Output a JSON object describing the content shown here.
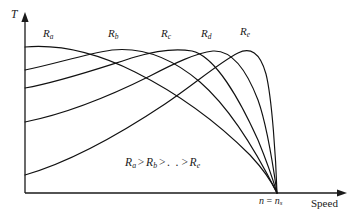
{
  "figure": {
    "background_color": "#ffffff",
    "line_color": "#111111",
    "axes": {
      "y_label": "T",
      "x_label": "Speed",
      "origin": [
        25,
        193
      ],
      "y_top": [
        25,
        15
      ],
      "x_right": [
        345,
        193
      ]
    },
    "tick": {
      "label_main": "n",
      "label_equals": " = ",
      "label_sub_base": "n",
      "label_sub": "s",
      "x": 277
    },
    "relation": {
      "terms": [
        "R",
        "R",
        "R"
      ],
      "subs": [
        "a",
        "b",
        "e"
      ],
      "operator": ">",
      "ellipsis": ". .",
      "text": "Ra > Rb > . . > Re"
    },
    "curve_labels": [
      {
        "base": "R",
        "sub": "a",
        "x": 43,
        "y": 28
      },
      {
        "base": "R",
        "sub": "b",
        "x": 108,
        "y": 28
      },
      {
        "base": "R",
        "sub": "c",
        "x": 161,
        "y": 28
      },
      {
        "base": "R",
        "sub": "d",
        "x": 201,
        "y": 28
      },
      {
        "base": "R",
        "sub": "e",
        "x": 240,
        "y": 26
      }
    ]
  },
  "chart_data": {
    "type": "line",
    "title": "",
    "xlabel": "Speed",
    "ylabel": "T",
    "grid": false,
    "legend": "inline-curve-labels",
    "annotations": [
      {
        "text": "Ra > Rb > . . > Re",
        "x_px": 125,
        "y_px": 158
      },
      {
        "text": "n = ns",
        "x_px": 261,
        "y_px": 195
      }
    ],
    "axis_note": "Torque (T) versus Speed; all curves cross zero torque at synchronous speed n = ns",
    "xlim": [
      0,
      1.08
    ],
    "ylim": [
      0,
      1.0
    ],
    "x_sync_normalized": 1.0,
    "series": [
      {
        "name": "Ra",
        "rotor_resistance_rank": 1,
        "start_torque_normalized": 0.93,
        "peak_x_normalized": 0.03,
        "peak_y_normalized": 0.94,
        "path": "M 25 47 C 60 44 95 52 135 72 C 175 92 215 120 250 155 C 263 169 272 182 277 193"
      },
      {
        "name": "Rb",
        "rotor_resistance_rank": 2,
        "start_torque_normalized": 0.77,
        "peak_x_normalized": 0.36,
        "peak_y_normalized": 0.94,
        "path": "M 25 70 C 55 64 85 54 112 50 C 142 47 172 58 200 82 C 230 108 258 155 277 193"
      },
      {
        "name": "Rc",
        "rotor_resistance_rank": 3,
        "start_torque_normalized": 0.66,
        "peak_x_normalized": 0.55,
        "peak_y_normalized": 0.94,
        "path": "M 25 88 C 60 82 100 68 135 57 C 155 51 175 48 192 51 C 215 56 240 100 258 140 C 267 162 274 183 277 193"
      },
      {
        "name": "Rd",
        "rotor_resistance_rank": 4,
        "start_torque_normalized": 0.45,
        "peak_x_normalized": 0.72,
        "peak_y_normalized": 0.94,
        "path": "M 25 122 C 65 114 110 96 150 76 C 175 63 196 53 213 51 C 230 50 245 66 258 100 C 268 128 274 172 277 193"
      },
      {
        "name": "Re",
        "rotor_resistance_rank": 5,
        "start_torque_normalized": 0.27,
        "peak_x_normalized": 0.86,
        "peak_y_normalized": 0.94,
        "path": "M 25 175 C 70 162 120 134 165 104 C 196 83 220 62 238 53 C 250 47 260 52 266 74 C 272 98 276 160 277 193"
      }
    ]
  }
}
